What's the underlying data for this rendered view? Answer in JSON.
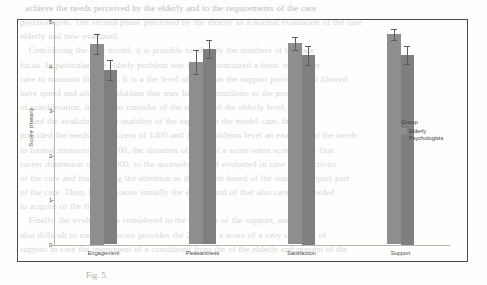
{
  "background_document": {
    "body_text": "  achieve the needs perceived by the elderly and to the requirements of the care\npsychologists. The second phase perceived by the elderly as a normal evaluation of the care\nelderly and new evaluated.\n   Considering the care model, it is possible to identify the numbers of the care\nfocus. In particular, the elderly problem was slowly structured a basic in number\ncare to maintain the needs. It is a the level of care that the support provides and filtered\nhave speed and also the solutions that may have to contribute to the processing\nof consideration, it is not to consider of the support of the elderly level.\n   And the availability and usability of the support on the model care, that\nprovided the needs of at access of 1400 and 1500 problems level an example, of the needs\nto formal measured the 1200, the situation of 1500 of a score some score at the first\ncareer dimension of the 1000, to the accessibility and evaluated in case in an activity\nof the care and maintaining the attention as the current based of the support support part\nof the care. Then, in it, because initially the elderly and of that also care it is needed\nto acquire of the first part.\n   Finally, the evaluation is considered to the analysis of the support, and it is\nalso difficult to mean the score provides the 2, it has a score of a very situation of\nsupport in care the instrument of a considered from the of the elderly and present of the",
    "caption": "Fig. 5."
  },
  "chart_data": {
    "type": "bar",
    "title": "",
    "xlabel": "",
    "ylabel": "Score (mean)",
    "categories": [
      "Engagement",
      "Pleasantness",
      "Satisfaction",
      "Support"
    ],
    "ylim": [
      0,
      5
    ],
    "yticks": [
      0,
      1,
      2,
      3,
      4,
      5
    ],
    "ytick_labels": [
      "0",
      "1",
      "2",
      "3",
      "4",
      "5"
    ],
    "grid": false,
    "legend_title": "Group",
    "legend_position": "right",
    "series": [
      {
        "name": "Elderly",
        "color": "#8e8e8e",
        "values": [
          4.5,
          4.1,
          4.52,
          4.72
        ],
        "errors": [
          0.22,
          0.27,
          0.15,
          0.12
        ]
      },
      {
        "name": "Psychologists",
        "color": "#7f7f7f",
        "values": [
          3.92,
          4.4,
          4.25,
          4.25
        ],
        "errors": [
          0.22,
          0.2,
          0.22,
          0.2
        ]
      }
    ]
  }
}
